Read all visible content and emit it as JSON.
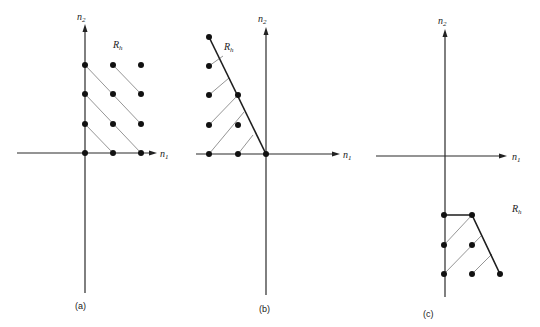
{
  "figure": {
    "panels": [
      {
        "id": "a",
        "caption": "(a)",
        "region_label": "R",
        "region_sub": "h",
        "x_axis_label": "n",
        "x_axis_sub": "1",
        "y_axis_label": "n",
        "y_axis_sub": "2",
        "support_points": [
          [
            0,
            0
          ],
          [
            1,
            0
          ],
          [
            2,
            0
          ],
          [
            0,
            1
          ],
          [
            1,
            1
          ],
          [
            2,
            1
          ],
          [
            0,
            2
          ],
          [
            1,
            2
          ],
          [
            2,
            2
          ],
          [
            0,
            3
          ],
          [
            1,
            3
          ],
          [
            2,
            3
          ]
        ],
        "description": "First-quadrant support region extending to infinity"
      },
      {
        "id": "b",
        "caption": "(b)",
        "region_label": "R",
        "region_sub": "h",
        "x_axis_label": "n",
        "x_axis_sub": "1",
        "y_axis_label": "n",
        "y_axis_sub": "2",
        "support_points": [
          [
            -2,
            0
          ],
          [
            -1,
            0
          ],
          [
            0,
            0
          ],
          [
            -2,
            1
          ],
          [
            -1,
            1
          ],
          [
            -2,
            2
          ],
          [
            -1,
            2
          ],
          [
            -2,
            3
          ],
          [
            -2,
            4
          ]
        ],
        "description": "Wedge support region in second quadrant bounded by a line through origin"
      },
      {
        "id": "c",
        "caption": "(c)",
        "region_label": "R",
        "region_sub": "h",
        "x_axis_label": "n",
        "x_axis_sub": "1",
        "y_axis_label": "n",
        "y_axis_sub": "2",
        "support_points": [
          [
            0,
            -2
          ],
          [
            1,
            -2
          ],
          [
            0,
            -3
          ],
          [
            1,
            -3
          ],
          [
            0,
            -4
          ],
          [
            1,
            -4
          ],
          [
            2,
            -4
          ]
        ],
        "description": "Finite support region in fourth quadrant"
      }
    ]
  }
}
